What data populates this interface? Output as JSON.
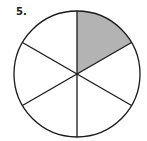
{
  "problem": {
    "number_label": "5."
  },
  "figure": {
    "type": "fraction-circle",
    "total_sectors": 6,
    "shaded_sectors": 1,
    "shaded_positions": [
      "top-right (12 o'clock to 2 o'clock)"
    ],
    "shaded_fraction": "1/6",
    "colors": {
      "shade": "#b3b3b3",
      "stroke": "#1a1a1a",
      "background": "#ffffff"
    }
  }
}
